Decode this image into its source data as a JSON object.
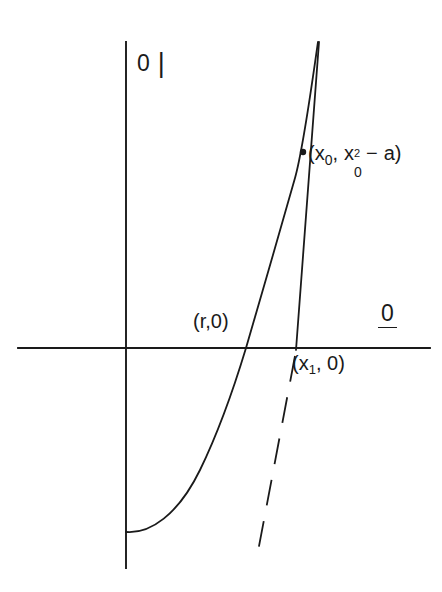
{
  "figure": {
    "kind": "newton-method-parabola-tangent-diagram",
    "background_color": "#ffffff",
    "ink_color": "#1a1a1a",
    "width": 442,
    "height": 592,
    "axes": {
      "origin": {
        "x": 126,
        "y": 348
      },
      "y_axis": {
        "x": 126,
        "y_top": 42,
        "y_bottom": 568
      },
      "x_axis": {
        "y": 348,
        "x_left": 18,
        "x_right": 430
      },
      "y_axis_label": "0",
      "y_axis_label_bar": "|",
      "x_axis_label": "0"
    },
    "labels": {
      "root_point": "(r,0)",
      "x1_point_open": "(x",
      "x1_point_sub": "1",
      "x1_point_close": ", 0)",
      "tangent_point_open": "(x",
      "tangent_point_sub_1": "0",
      "tangent_point_comma": ",",
      "tangent_point_x": "x",
      "tangent_point_sup": "2",
      "tangent_point_sub_2": "0",
      "tangent_point_minus": "−",
      "tangent_point_a": "a",
      "tangent_point_close": ")"
    },
    "curve": {
      "name": "parabola",
      "description": "y = x^2 - a, vertex on the y-axis, rising to the right",
      "style": "solid",
      "vertex_px": {
        "x": 126,
        "y": 532
      },
      "root_px": {
        "x": 246,
        "y": 348
      },
      "top_px": {
        "x": 318,
        "y": 42
      }
    },
    "tangent": {
      "name": "tangent-line",
      "style_upper": "solid",
      "style_lower": "dashed",
      "tangent_point_px": {
        "x": 303,
        "y": 152
      },
      "x_intercept_px": {
        "x": 296,
        "y": 348
      },
      "top_px": {
        "x": 319,
        "y": 42
      },
      "dash_end_px": {
        "x": 256,
        "y": 562
      },
      "dash_pattern": "26 16"
    },
    "markers": {
      "tangent_point_dot_radius": 3.2
    }
  }
}
